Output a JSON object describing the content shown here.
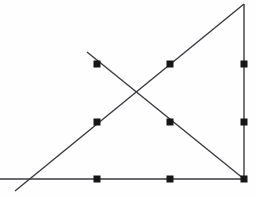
{
  "figure": {
    "canvas": {
      "width": 256,
      "height": 197,
      "background_color": "#fefefe"
    },
    "style": {
      "line_color": "#3a3a44",
      "line_width": 1.4,
      "marker_color": "#161616",
      "marker_size": 7,
      "marker_shape": "square"
    },
    "segments": [
      {
        "name": "baseline-horizontal",
        "label": "horizontal base line",
        "x1": 0,
        "y1": 179,
        "x2": 245,
        "y2": 179
      },
      {
        "name": "ascending-diagonal",
        "label": "ascending diagonal from lower-left to apex",
        "x1": 15,
        "y1": 191,
        "x2": 244,
        "y2": 4
      },
      {
        "name": "descending-diagonal",
        "label": "descending diagonal from upper-left to lower-right corner",
        "x1": 87,
        "y1": 52,
        "x2": 244,
        "y2": 179
      },
      {
        "name": "right-vertical",
        "label": "vertical right edge",
        "x1": 244,
        "y1": 4,
        "x2": 244,
        "y2": 179
      }
    ],
    "points": [
      {
        "name": "point-upper-left",
        "x": 97,
        "y": 64
      },
      {
        "name": "point-upper-mid",
        "x": 170,
        "y": 64
      },
      {
        "name": "point-upper-right",
        "x": 244,
        "y": 64
      },
      {
        "name": "point-middle-left",
        "x": 97,
        "y": 122
      },
      {
        "name": "point-middle-mid",
        "x": 170,
        "y": 122
      },
      {
        "name": "point-middle-right",
        "x": 244,
        "y": 122
      },
      {
        "name": "point-lower-left",
        "x": 97,
        "y": 179
      },
      {
        "name": "point-lower-mid",
        "x": 170,
        "y": 179
      },
      {
        "name": "point-lower-right",
        "x": 244,
        "y": 179
      }
    ],
    "intersection": {
      "name": "diagonal-crossing",
      "x": 137,
      "y": 97
    }
  }
}
